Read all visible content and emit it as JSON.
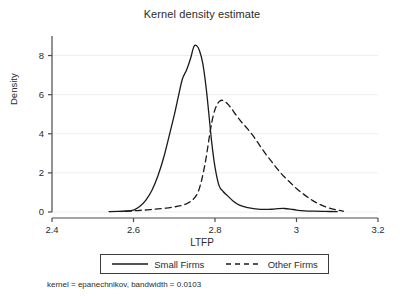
{
  "chart_data": {
    "type": "line",
    "title": "Kernel density estimate",
    "xlabel": "LTFP",
    "ylabel": "Density",
    "xlim": [
      2.4,
      3.2
    ],
    "ylim": [
      0,
      9
    ],
    "xticks": [
      "2.4",
      "2.6",
      "2.8",
      "3",
      "3.2"
    ],
    "xtick_values": [
      2.4,
      2.6,
      2.8,
      3.0,
      3.2
    ],
    "yticks": [
      "0",
      "2",
      "4",
      "6",
      "8"
    ],
    "ytick_values": [
      0,
      2,
      4,
      6,
      8
    ],
    "grid": "horizontal",
    "legend_position": "below-axis",
    "footnote": "kernel = epanechnikov, bandwidth = 0.0103",
    "series": [
      {
        "name": "Small Firms",
        "style": "solid",
        "color": "#1a1a1a",
        "peak_x": 2.75,
        "peak_y": 8.5,
        "x": [
          2.54,
          2.56,
          2.58,
          2.6,
          2.615,
          2.63,
          2.645,
          2.66,
          2.675,
          2.69,
          2.7,
          2.71,
          2.72,
          2.73,
          2.74,
          2.748,
          2.755,
          2.762,
          2.77,
          2.778,
          2.785,
          2.792,
          2.8,
          2.81,
          2.82,
          2.83,
          2.845,
          2.86,
          2.88,
          2.9,
          2.92,
          2.94,
          2.955,
          2.97,
          2.985,
          3.0,
          3.02,
          3.045,
          3.07,
          3.1
        ],
        "y": [
          0.02,
          0.03,
          0.05,
          0.1,
          0.28,
          0.6,
          1.1,
          1.85,
          2.85,
          4.1,
          4.95,
          5.9,
          6.8,
          7.25,
          7.85,
          8.45,
          8.5,
          8.25,
          7.6,
          6.4,
          5.0,
          3.55,
          2.3,
          1.35,
          1.05,
          0.85,
          0.55,
          0.35,
          0.22,
          0.16,
          0.13,
          0.14,
          0.17,
          0.18,
          0.15,
          0.1,
          0.06,
          0.04,
          0.03,
          0.02
        ]
      },
      {
        "name": "Other Firms",
        "style": "dashed",
        "color": "#1a1a1a",
        "peak_x": 2.81,
        "peak_y": 5.7,
        "x": [
          2.58,
          2.6,
          2.62,
          2.64,
          2.66,
          2.68,
          2.7,
          2.715,
          2.73,
          2.745,
          2.758,
          2.768,
          2.778,
          2.788,
          2.796,
          2.804,
          2.812,
          2.82,
          2.83,
          2.84,
          2.852,
          2.865,
          2.88,
          2.895,
          2.91,
          2.925,
          2.94,
          2.955,
          2.97,
          2.985,
          3.0,
          3.015,
          3.03,
          3.045,
          3.06,
          3.075,
          3.09,
          3.105,
          3.115
        ],
        "y": [
          0.03,
          0.06,
          0.09,
          0.12,
          0.16,
          0.2,
          0.26,
          0.32,
          0.42,
          0.62,
          1.0,
          1.7,
          2.75,
          4.1,
          4.95,
          5.45,
          5.68,
          5.7,
          5.55,
          5.3,
          4.95,
          4.6,
          4.25,
          3.85,
          3.4,
          2.95,
          2.55,
          2.15,
          1.8,
          1.5,
          1.2,
          0.95,
          0.72,
          0.52,
          0.36,
          0.24,
          0.15,
          0.08,
          0.04
        ]
      }
    ]
  },
  "axis_geometry": {
    "left": 52,
    "right": 378,
    "bottom": 212,
    "top": 36
  },
  "legend": {
    "entries": [
      {
        "label": "Small Firms",
        "style": "solid"
      },
      {
        "label": "Other Firms",
        "style": "dashed"
      }
    ]
  }
}
